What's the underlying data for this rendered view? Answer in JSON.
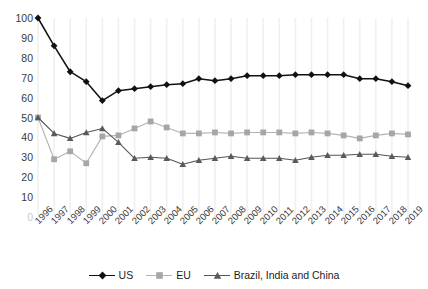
{
  "chart_data": {
    "type": "line",
    "title": "",
    "subtitle": "",
    "xlabel": "",
    "ylabel": "",
    "x": [
      1996,
      1997,
      1998,
      1999,
      2000,
      2001,
      2002,
      2003,
      2004,
      2005,
      2006,
      2007,
      2008,
      2009,
      2010,
      2011,
      2012,
      2013,
      2014,
      2015,
      2016,
      2017,
      2018,
      2019
    ],
    "categories": [
      "1996",
      "1997",
      "1998",
      "1999",
      "2000",
      "2001",
      "2002",
      "2003",
      "2004",
      "2005",
      "2006",
      "2007",
      "2008",
      "2009",
      "2010",
      "2011",
      "2012",
      "2013",
      "2014",
      "2015",
      "2016",
      "2017",
      "2018",
      "2019"
    ],
    "xlim": [
      1996,
      2019
    ],
    "ylim": [
      0,
      100
    ],
    "yticks": [
      0,
      10,
      20,
      30,
      40,
      50,
      60,
      70,
      80,
      90,
      100
    ],
    "ytick_labels": [
      "0",
      "10",
      "20",
      "30",
      "40",
      "50",
      "60",
      "70",
      "80",
      "90",
      "100"
    ],
    "grid": "vertical-only-faint",
    "legend_position": "bottom-center",
    "series": [
      {
        "name": "US",
        "marker": "diamond",
        "color": "#111111",
        "line_color": "#111111",
        "values": [
          100,
          86,
          73,
          68,
          58.5,
          63.5,
          64.5,
          65.5,
          66.5,
          67,
          69.5,
          68.5,
          69.5,
          71,
          71,
          71,
          71.5,
          71.5,
          71.5,
          71.5,
          69.5,
          69.5,
          68,
          66
        ]
      },
      {
        "name": "EU",
        "marker": "square",
        "color": "#a6a6a6",
        "line_color": "#b3b3b3",
        "values": [
          50,
          29,
          33,
          27,
          40.5,
          41,
          44.5,
          48,
          45,
          42,
          42,
          42.5,
          42,
          42.5,
          42.5,
          42.5,
          42,
          42.5,
          42,
          41,
          39.5,
          41,
          42,
          41.5
        ]
      },
      {
        "name": "Brazil, India and China",
        "marker": "triangle",
        "color": "#5a5a5a",
        "line_color": "#555555",
        "values": [
          50,
          42,
          39.5,
          42.5,
          44.5,
          37.5,
          29.5,
          30,
          29.5,
          26.5,
          28.5,
          29.5,
          30.5,
          29.5,
          29.5,
          29.5,
          28.5,
          30,
          31,
          31,
          31.5,
          31.5,
          30.5,
          30
        ]
      }
    ]
  },
  "legend": {
    "entries": [
      {
        "label": "US"
      },
      {
        "label": "EU"
      },
      {
        "label": "Brazil, India and China"
      }
    ]
  }
}
